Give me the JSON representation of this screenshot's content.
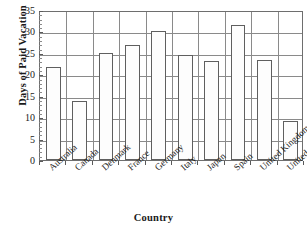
{
  "chart_data": {
    "type": "bar",
    "title": "",
    "xlabel": "Country",
    "ylabel": "Days of Paid Vacation",
    "categories": [
      "Australia",
      "Canada",
      "Denmark",
      "France",
      "Germany",
      "Italy",
      "Japan",
      "Spain",
      "United Kingdom",
      "United States"
    ],
    "values": [
      21.6,
      13.8,
      25.0,
      26.8,
      30.0,
      24.4,
      23.2,
      31.5,
      23.4,
      9.2
    ],
    "ylim": [
      0,
      35
    ],
    "ytick_labels": [
      "0",
      "5",
      "10",
      "15",
      "20",
      "25",
      "30",
      "35"
    ],
    "ytick_values": [
      0,
      5,
      10,
      15,
      20,
      25,
      30,
      35
    ],
    "yminor_step": 1,
    "grid": "horizontal-and-vertical",
    "legend": "none",
    "bar_fill_color": "#fdfdfd",
    "bar_edge_color": "#5f5f5f",
    "grid_color": "#8a8a8a",
    "axis_color": "#6e6e6e",
    "text_color": "#1a1a1a"
  }
}
